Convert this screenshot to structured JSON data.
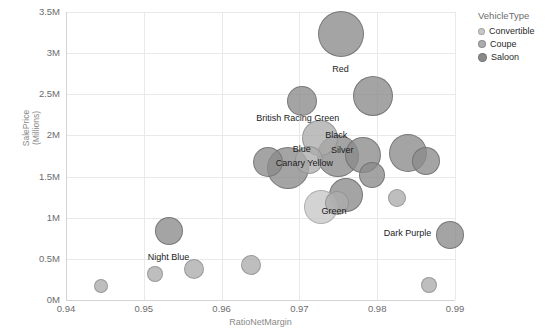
{
  "chart_data": {
    "type": "scatter",
    "title": "",
    "xlabel": "RatioNetMargin",
    "ylabel": "SalePrice\n(Millions)",
    "xlim": [
      0.94,
      0.99
    ],
    "ylim": [
      0,
      3500000
    ],
    "grid": true,
    "xticks": [
      "0.94",
      "0.95",
      "0.96",
      "0.97",
      "0.98",
      "0.99"
    ],
    "xtick_values": [
      0.94,
      0.95,
      0.96,
      0.97,
      0.98,
      0.99
    ],
    "yticks": [
      "0M",
      "0.5M",
      "1M",
      "1.5M",
      "2M",
      "2.5M",
      "3M",
      "3.5M"
    ],
    "ytick_values": [
      0,
      500000,
      1000000,
      1500000,
      2000000,
      2500000,
      3000000,
      3500000
    ],
    "legend": {
      "title": "VehicleType",
      "position": "right",
      "entries": [
        {
          "label": "Convertible",
          "color": "#c8c8c8",
          "size": 7
        },
        {
          "label": "Coupe",
          "color": "#acacac",
          "size": 8
        },
        {
          "label": "Saloon",
          "color": "#8a8a8a",
          "size": 9
        }
      ]
    },
    "size_encoding": "bubble radius encodes volume",
    "points": [
      {
        "label": "Red",
        "x": 0.9753,
        "y": 3230000,
        "r": 23,
        "type": "saloon",
        "label_dx": 0,
        "label_dy": 35
      },
      {
        "label": "British Racing Green",
        "x": 0.9703,
        "y": 2420000,
        "r": 15,
        "type": "saloon",
        "label_dx": -4,
        "label_dy": 17
      },
      {
        "label": "",
        "x": 0.9795,
        "y": 2480000,
        "r": 20,
        "type": "saloon",
        "label_dx": 0,
        "label_dy": 0
      },
      {
        "label": "Canary Yellow",
        "x": 0.9727,
        "y": 1965000,
        "r": 18,
        "type": "coupe",
        "label_dx": -16,
        "label_dy": 25
      },
      {
        "label": "Silver",
        "x": 0.9782,
        "y": 1760000,
        "r": 18,
        "type": "saloon",
        "label_dx": -21,
        "label_dy": -5
      },
      {
        "label": "Black",
        "x": 0.975,
        "y": 1755000,
        "r": 21,
        "type": "saloon",
        "label_dx": -2,
        "label_dy": -21
      },
      {
        "label": "",
        "x": 0.984,
        "y": 1790000,
        "r": 19,
        "type": "saloon",
        "label_dx": 0,
        "label_dy": 0
      },
      {
        "label": "",
        "x": 0.9863,
        "y": 1690000,
        "r": 14,
        "type": "saloon",
        "label_dx": 0,
        "label_dy": 0
      },
      {
        "label": "",
        "x": 0.966,
        "y": 1680000,
        "r": 15,
        "type": "saloon",
        "label_dx": 0,
        "label_dy": 0
      },
      {
        "label": "Blue",
        "x": 0.9685,
        "y": 1605000,
        "r": 21,
        "type": "saloon",
        "label_dx": 14,
        "label_dy": -19
      },
      {
        "label": "",
        "x": 0.9712,
        "y": 1705000,
        "r": 14,
        "type": "coupe",
        "label_dx": 0,
        "label_dy": 0
      },
      {
        "label": "",
        "x": 0.9793,
        "y": 1525000,
        "r": 13,
        "type": "saloon",
        "label_dx": 0,
        "label_dy": 0
      },
      {
        "label": "Green",
        "x": 0.976,
        "y": 1280000,
        "r": 17,
        "type": "saloon",
        "label_dx": -12,
        "label_dy": 16
      },
      {
        "label": "",
        "x": 0.9748,
        "y": 1175000,
        "r": 12,
        "type": "coupe",
        "label_dx": 0,
        "label_dy": 0
      },
      {
        "label": "",
        "x": 0.9728,
        "y": 1125000,
        "r": 17,
        "type": "convertible",
        "label_dx": 0,
        "label_dy": 0
      },
      {
        "label": "",
        "x": 0.9825,
        "y": 1240000,
        "r": 9,
        "type": "coupe",
        "label_dx": 0,
        "label_dy": 0
      },
      {
        "label": "Night Blue",
        "x": 0.9533,
        "y": 840000,
        "r": 14,
        "type": "saloon",
        "label_dx": -1,
        "label_dy": 26
      },
      {
        "label": "Dark Purple",
        "x": 0.9893,
        "y": 790000,
        "r": 14,
        "type": "saloon",
        "label_dx": -42,
        "label_dy": -2
      },
      {
        "label": "",
        "x": 0.9638,
        "y": 420000,
        "r": 10,
        "type": "coupe",
        "label_dx": 0,
        "label_dy": 0
      },
      {
        "label": "",
        "x": 0.9565,
        "y": 375000,
        "r": 10,
        "type": "coupe",
        "label_dx": 0,
        "label_dy": 0
      },
      {
        "label": "",
        "x": 0.9515,
        "y": 310000,
        "r": 8,
        "type": "coupe",
        "label_dx": 0,
        "label_dy": 0
      },
      {
        "label": "",
        "x": 0.9445,
        "y": 175000,
        "r": 7,
        "type": "coupe",
        "label_dx": 0,
        "label_dy": 0
      },
      {
        "label": "",
        "x": 0.9867,
        "y": 180000,
        "r": 8,
        "type": "coupe",
        "label_dx": 0,
        "label_dy": 0
      }
    ]
  }
}
